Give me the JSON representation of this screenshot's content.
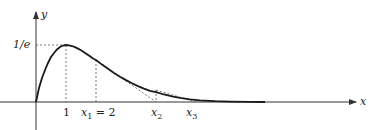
{
  "diagram": {
    "function": "y = x e^{-x}",
    "axes": {
      "x_label": "x",
      "y_label": "y"
    },
    "labels": {
      "y_max": "1/e",
      "x_peak": "1",
      "x1": "x",
      "x1_sub": "1",
      "x1_eq": " = 2",
      "x2": "x",
      "x2_sub": "2",
      "x3": "x",
      "x3_sub": "3"
    },
    "points": {
      "peak": {
        "x": 1,
        "y": 0.3679
      },
      "x1": 2,
      "x2": 4,
      "x3": 5.333
    },
    "colors": {
      "curve": "#1a1a1a",
      "axis": "#333333",
      "dashed": "#555555"
    }
  }
}
